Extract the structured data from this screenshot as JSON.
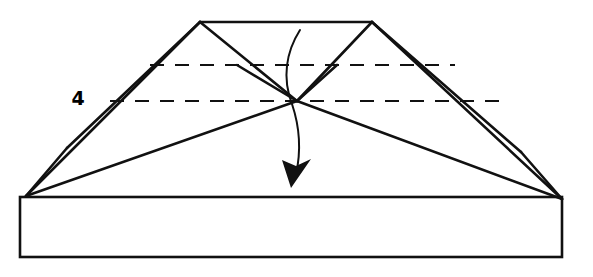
{
  "figure": {
    "step_label": "4",
    "step_label_position": {
      "x": 78,
      "y": 105
    },
    "canvas": {
      "width": 593,
      "height": 277
    },
    "ink_color": "#111111",
    "background_color": "#ffffff",
    "line_width_main": 2.6,
    "line_width_thin": 2.0,
    "dash_pattern": "14 11"
  },
  "geometry": {
    "points": {
      "top_left_apex": {
        "x": 200,
        "y": 22
      },
      "top_right_apex": {
        "x": 372,
        "y": 22
      },
      "left_tip": {
        "x": 26,
        "y": 196
      },
      "right_tip": {
        "x": 562,
        "y": 199
      },
      "left_wing_node": {
        "x": 67,
        "y": 148
      },
      "right_wing_node": {
        "x": 521,
        "y": 152
      },
      "center_vertex": {
        "x": 297,
        "y": 101
      },
      "left_inner_node": {
        "x": 237,
        "y": 65
      },
      "right_inner_node": {
        "x": 337,
        "y": 65
      },
      "base_top_left": {
        "x": 20,
        "y": 197
      },
      "base_top_right": {
        "x": 562,
        "y": 199
      },
      "base_bottom_left": {
        "x": 20,
        "y": 257
      },
      "base_bottom_right": {
        "x": 562,
        "y": 257
      }
    },
    "solid_edges": [
      {
        "name": "top-ridge-edge",
        "from": "top_left_apex",
        "to": "top_right_apex"
      },
      {
        "name": "left-outer-slope",
        "from": "top_left_apex",
        "to": "left_tip"
      },
      {
        "name": "right-outer-slope",
        "from": "top_right_apex",
        "to": "right_tip"
      },
      {
        "name": "left-wing-upper",
        "from": "top_left_apex",
        "to": "left_wing_node"
      },
      {
        "name": "right-wing-upper",
        "from": "top_right_apex",
        "to": "right_wing_node"
      },
      {
        "name": "left-wing-lower",
        "from": "left_wing_node",
        "to": "left_tip"
      },
      {
        "name": "right-wing-lower",
        "from": "right_wing_node",
        "to": "right_tip"
      },
      {
        "name": "left-diagonal-to-center",
        "from": "top_left_apex",
        "to": "center_vertex"
      },
      {
        "name": "right-diagonal-to-center",
        "from": "top_right_apex",
        "to": "center_vertex"
      },
      {
        "name": "left-valley-to-tip",
        "from": "center_vertex",
        "to": "left_tip"
      },
      {
        "name": "right-valley-to-tip",
        "from": "center_vertex",
        "to": "right_tip"
      },
      {
        "name": "left-short-spur",
        "from": "left_inner_node",
        "to": "center_vertex"
      },
      {
        "name": "right-short-spur",
        "from": "right_inner_node",
        "to": "center_vertex"
      }
    ],
    "dashed_edges": [
      {
        "name": "upper-fold-line",
        "x1": 150,
        "y1": 65,
        "x2": 455,
        "y2": 65
      },
      {
        "name": "lower-fold-line",
        "x1": 110,
        "y1": 101,
        "x2": 506,
        "y2": 101
      }
    ],
    "base_rectangle": {
      "name": "base-band",
      "x": 20,
      "y": 197,
      "width": 542,
      "height": 60
    },
    "fold_arrow": {
      "name": "fold-direction-arrow",
      "path": "M 300 30 C 286 52, 282 78, 292 104 C 300 128, 301 152, 296 174",
      "arrow_tip": {
        "x": 291,
        "y": 188
      },
      "arrow_polygon": "291,188 282,160 296,166 311,159"
    }
  }
}
